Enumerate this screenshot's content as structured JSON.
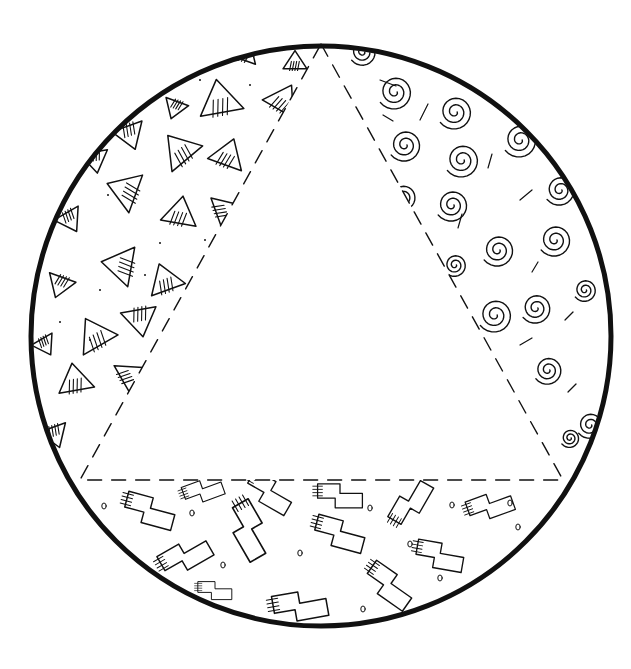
{
  "canvas": {
    "width": 631,
    "height": 669,
    "background": "#ffffff",
    "ink": "#111111"
  },
  "circle": {
    "cx": 321,
    "cy": 336,
    "r": 290,
    "stroke_width": 5
  },
  "triangle": {
    "apex": [
      321,
      44
    ],
    "base_left": [
      80,
      480
    ],
    "base_right": [
      563,
      480
    ],
    "dash": "14 10",
    "stroke_width": 1.4
  },
  "regions": {
    "left": {
      "pattern": "hatched-triangles",
      "items": [
        [
          245,
          52,
          14,
          20
        ],
        [
          295,
          62,
          12,
          0
        ],
        [
          220,
          100,
          22,
          -10
        ],
        [
          283,
          100,
          18,
          30
        ],
        [
          175,
          108,
          12,
          200
        ],
        [
          130,
          135,
          16,
          160
        ],
        [
          180,
          150,
          20,
          -40
        ],
        [
          228,
          155,
          18,
          20
        ],
        [
          95,
          160,
          14,
          170
        ],
        [
          125,
          190,
          20,
          -70
        ],
        [
          180,
          213,
          18,
          10
        ],
        [
          225,
          210,
          16,
          70
        ],
        [
          70,
          220,
          14,
          150
        ],
        [
          120,
          265,
          20,
          -80
        ],
        [
          165,
          280,
          18,
          -20
        ],
        [
          60,
          285,
          14,
          200
        ],
        [
          140,
          320,
          18,
          170
        ],
        [
          95,
          335,
          20,
          -30
        ],
        [
          45,
          345,
          12,
          150
        ],
        [
          130,
          375,
          16,
          60
        ],
        [
          75,
          380,
          18,
          -10
        ],
        [
          55,
          435,
          14,
          160
        ]
      ],
      "dots": [
        [
          200,
          80
        ],
        [
          250,
          85
        ],
        [
          108,
          195
        ],
        [
          205,
          240
        ],
        [
          160,
          243
        ],
        [
          100,
          290
        ],
        [
          60,
          322
        ],
        [
          90,
          340
        ],
        [
          145,
          275
        ],
        [
          215,
          330
        ]
      ]
    },
    "right": {
      "pattern": "spirals",
      "items": [
        [
          363,
          52,
          14
        ],
        [
          395,
          92,
          18
        ],
        [
          455,
          112,
          18
        ],
        [
          505,
          95,
          12
        ],
        [
          405,
          145,
          17
        ],
        [
          462,
          160,
          18
        ],
        [
          520,
          140,
          18
        ],
        [
          403,
          197,
          14
        ],
        [
          452,
          205,
          17
        ],
        [
          560,
          190,
          16
        ],
        [
          498,
          250,
          17
        ],
        [
          555,
          240,
          17
        ],
        [
          455,
          265,
          12
        ],
        [
          536,
          308,
          16
        ],
        [
          495,
          315,
          18
        ],
        [
          585,
          290,
          12
        ],
        [
          548,
          370,
          15
        ],
        [
          590,
          425,
          14
        ],
        [
          570,
          438,
          10
        ]
      ],
      "ticks": [
        [
          380,
          80,
          396,
          86
        ],
        [
          420,
          120,
          428,
          104
        ],
        [
          383,
          115,
          393,
          121
        ],
        [
          488,
          168,
          492,
          154
        ],
        [
          520,
          200,
          532,
          190
        ],
        [
          458,
          228,
          462,
          214
        ],
        [
          532,
          272,
          538,
          262
        ],
        [
          565,
          320,
          573,
          312
        ],
        [
          520,
          345,
          532,
          338
        ],
        [
          568,
          392,
          576,
          384
        ]
      ]
    },
    "bottom": {
      "pattern": "stepped-blocks",
      "items": [
        [
          150,
          510,
          0.9,
          15
        ],
        [
          203,
          490,
          0.7,
          -20
        ],
        [
          270,
          492,
          0.85,
          30
        ],
        [
          340,
          495,
          0.8,
          0
        ],
        [
          410,
          502,
          0.85,
          -60
        ],
        [
          490,
          505,
          0.8,
          -20
        ],
        [
          250,
          530,
          1.0,
          60
        ],
        [
          340,
          533,
          0.9,
          15
        ],
        [
          185,
          555,
          0.9,
          -30
        ],
        [
          440,
          555,
          0.85,
          10
        ],
        [
          390,
          585,
          0.9,
          35
        ],
        [
          300,
          605,
          0.95,
          -10
        ],
        [
          215,
          590,
          0.6,
          0
        ]
      ],
      "dots": [
        [
          104,
          506
        ],
        [
          192,
          513
        ],
        [
          370,
          508
        ],
        [
          452,
          505
        ],
        [
          518,
          527
        ],
        [
          300,
          553
        ],
        [
          223,
          565
        ],
        [
          410,
          544
        ],
        [
          440,
          578
        ],
        [
          363,
          609
        ],
        [
          510,
          503
        ]
      ]
    }
  },
  "center": {
    "content": ""
  }
}
